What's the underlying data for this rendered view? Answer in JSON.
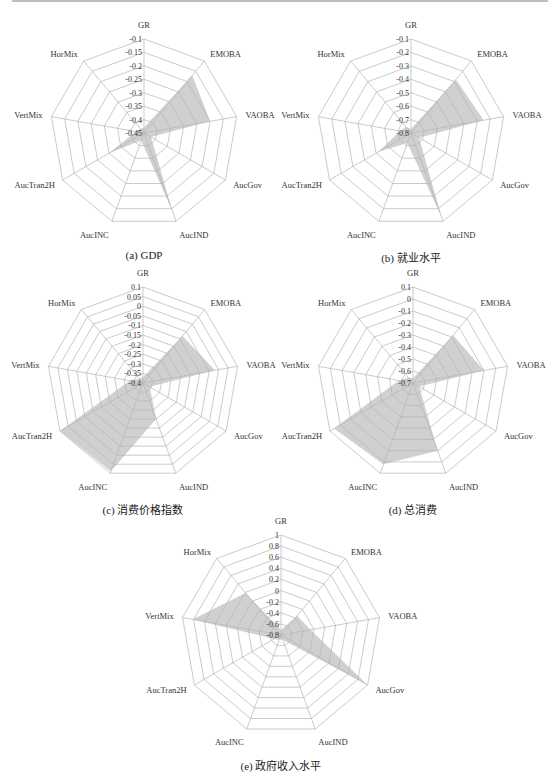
{
  "axes": [
    "GR",
    "EMOBA",
    "VAOBA",
    "AucGov",
    "AucIND",
    "AucINC",
    "AucTran2H",
    "VertMix",
    "HorMix"
  ],
  "colors": {
    "fill": "#c8c8c8",
    "grid": "#b5b5b5",
    "text": "#333333"
  },
  "chart_data": [
    {
      "type": "radar",
      "id": "a",
      "caption": "(a)  GDP",
      "categories": [
        "GR",
        "EMOBA",
        "VAOBA",
        "AucGov",
        "AucIND",
        "AucINC",
        "AucTran2H",
        "VertMix",
        "HorMix"
      ],
      "ticks": [
        "-0.1",
        "-0.15",
        "-0.2",
        "-0.25",
        "-0.3",
        "-0.35",
        "-0.4",
        "-0.45"
      ],
      "range": [
        -0.45,
        -0.1
      ],
      "values": [
        -0.43,
        -0.17,
        -0.2,
        -0.42,
        -0.14,
        -0.42,
        -0.3,
        -0.42,
        -0.43
      ],
      "center": [
        144,
        133
      ],
      "radius": 94
    },
    {
      "type": "radar",
      "id": "b",
      "caption": "(b)  就业水平",
      "categories": [
        "GR",
        "EMOBA",
        "VAOBA",
        "AucGov",
        "AucIND",
        "AucINC",
        "AucTran2H",
        "VertMix",
        "HorMix"
      ],
      "ticks": [
        "-0.1",
        "-0.2",
        "-0.3",
        "-0.4",
        "-0.5",
        "-0.6",
        "-0.7",
        "-0.8"
      ],
      "range": [
        -0.8,
        -0.1
      ],
      "values": [
        -0.77,
        -0.28,
        -0.25,
        -0.73,
        -0.14,
        -0.72,
        -0.52,
        -0.72,
        -0.74
      ],
      "center": [
        411,
        133
      ],
      "radius": 94
    },
    {
      "type": "radar",
      "id": "c",
      "caption": "(c)  消费价格指数",
      "categories": [
        "GR",
        "EMOBA",
        "VAOBA",
        "AucGov",
        "AucIND",
        "AucINC",
        "AucTran2H",
        "VertMix",
        "HorMix"
      ],
      "ticks": [
        "0.1",
        "0.05",
        "0",
        "-0.05",
        "-0.1",
        "-0.15",
        "-0.2",
        "-0.25",
        "-0.3",
        "-0.35",
        "-0.4"
      ],
      "range": [
        -0.4,
        0.1
      ],
      "values": [
        -0.37,
        -0.08,
        -0.02,
        -0.36,
        -0.2,
        0.09,
        0.1,
        -0.33,
        -0.37
      ],
      "center": [
        143,
        383
      ],
      "radius": 96
    },
    {
      "type": "radar",
      "id": "d",
      "caption": "(d)  总消费",
      "categories": [
        "GR",
        "EMOBA",
        "VAOBA",
        "AucGov",
        "AucIND",
        "AucINC",
        "AucTran2H",
        "VertMix",
        "HorMix"
      ],
      "ticks": [
        "0.1",
        "0",
        "-0.1",
        "-0.2",
        "-0.3",
        "-0.4",
        "-0.5",
        "-0.6",
        "-0.7"
      ],
      "range": [
        -0.7,
        0.1
      ],
      "values": [
        -0.66,
        -0.18,
        -0.1,
        -0.64,
        -0.1,
        0.02,
        0.06,
        -0.58,
        -0.64
      ],
      "center": [
        413,
        383
      ],
      "radius": 96
    },
    {
      "type": "radar",
      "id": "e",
      "caption": "(e)  政府收入水平",
      "categories": [
        "GR",
        "EMOBA",
        "VAOBA",
        "AucGov",
        "AucIND",
        "AucINC",
        "AucTran2H",
        "VertMix",
        "HorMix"
      ],
      "ticks": [
        "1",
        "0.8",
        "0.6",
        "0.4",
        "0.2",
        "0",
        "-0.2",
        "-0.4",
        "-0.6",
        "-0.8"
      ],
      "range": [
        -0.8,
        1
      ],
      "values": [
        -0.71,
        -0.35,
        -0.26,
        1.0,
        -0.71,
        -0.71,
        -0.66,
        0.82,
        0.19
      ],
      "center": [
        281,
        635
      ],
      "radius": 100
    }
  ]
}
